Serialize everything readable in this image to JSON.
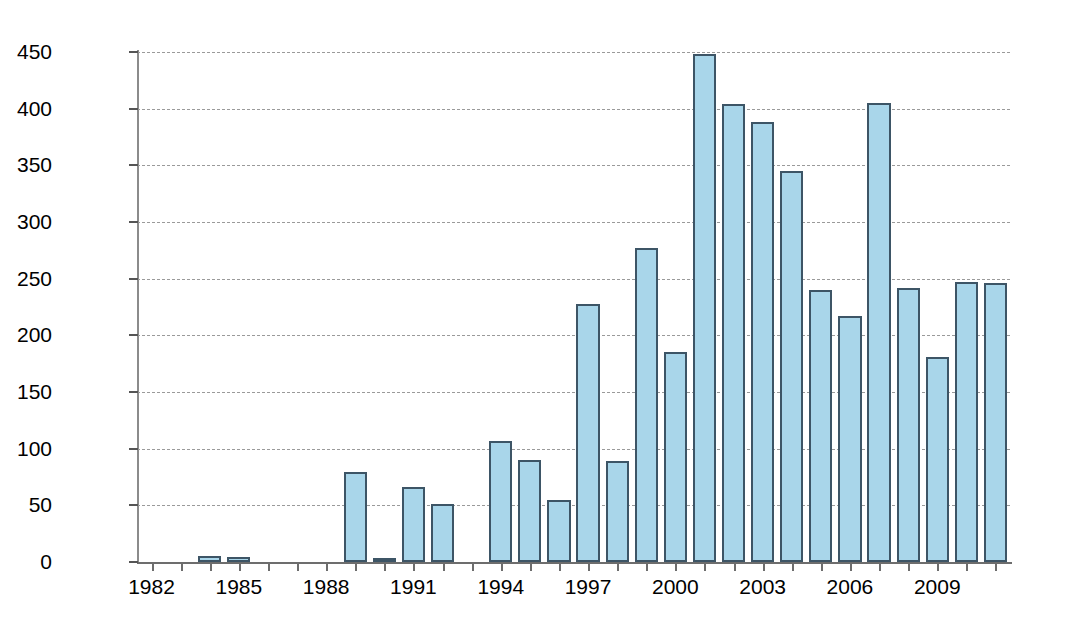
{
  "chart_data": {
    "type": "bar",
    "title": "",
    "xlabel": "",
    "ylabel": "Water Purchases (1,000 acre-feet)",
    "ylim": [
      0,
      450
    ],
    "ytick_labels": [
      "0",
      "50",
      "100",
      "150",
      "200",
      "250",
      "300",
      "350",
      "400",
      "450"
    ],
    "ytick_values": [
      0,
      50,
      100,
      150,
      200,
      250,
      300,
      350,
      400,
      450
    ],
    "xtick_labels": [
      "1982",
      "1985",
      "1988",
      "1991",
      "1994",
      "1997",
      "2000",
      "2003",
      "2006",
      "2009"
    ],
    "xtick_values": [
      1982,
      1985,
      1988,
      1991,
      1994,
      1997,
      2000,
      2003,
      2006,
      2009
    ],
    "grid": "horizontal-dashed",
    "legend": "none",
    "bar_color": "#a9d6ea",
    "bar_edge_color": "#3d5566",
    "categories": [
      1982,
      1983,
      1984,
      1985,
      1986,
      1987,
      1988,
      1989,
      1990,
      1991,
      1992,
      1993,
      1994,
      1995,
      1996,
      1997,
      1998,
      1999,
      2000,
      2001,
      2002,
      2003,
      2004,
      2005,
      2006,
      2007,
      2008,
      2009,
      2010,
      2011
    ],
    "values": [
      0,
      0,
      5,
      4,
      0,
      0,
      0,
      79,
      2,
      66,
      51,
      0,
      107,
      90,
      55,
      228,
      89,
      277,
      185,
      448,
      404,
      388,
      345,
      240,
      217,
      405,
      242,
      181,
      247,
      246
    ]
  }
}
